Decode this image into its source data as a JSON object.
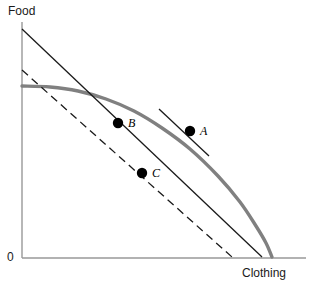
{
  "figure": {
    "width": 318,
    "height": 286,
    "background": "#ffffff"
  },
  "axes": {
    "y_title": "Food",
    "x_title": "Clothing",
    "origin_label": "0",
    "color": "#999999",
    "x_origin_px": 22,
    "y_origin_px": 258,
    "x_end_px": 306,
    "y_top_px": 22
  },
  "labels": {
    "point_a": "A",
    "point_b": "B",
    "point_c": "C"
  },
  "colors": {
    "ppf_curve": "#808080",
    "budget_line": "#1a1a1a",
    "dashed_line": "#1a1a1a",
    "tangent_line": "#1a1a1a",
    "point_fill": "#000000",
    "axis": "#999999",
    "text": "#1a1a1a"
  },
  "chart_data": {
    "type": "line",
    "title": "",
    "xlabel": "Clothing",
    "ylabel": "Food",
    "grid": false,
    "legend": "none",
    "xlim": [
      0,
      306
    ],
    "ylim": [
      0,
      258
    ],
    "series": [
      {
        "name": "Production possibility frontier",
        "style": "solid-thick",
        "color": "#808080",
        "width": 3.4,
        "points": [
          [
            22,
            86
          ],
          [
            50,
            87
          ],
          [
            78,
            91
          ],
          [
            106,
            99
          ],
          [
            134,
            111
          ],
          [
            162,
            128
          ],
          [
            190,
            149
          ],
          [
            218,
            176
          ],
          [
            240,
            202
          ],
          [
            256,
            226
          ],
          [
            266,
            243
          ],
          [
            272,
            257
          ]
        ]
      },
      {
        "name": "Budget line through A",
        "style": "solid",
        "color": "#1a1a1a",
        "width": 1.3,
        "points": [
          [
            22,
            29
          ],
          [
            262,
            257
          ]
        ]
      },
      {
        "name": "Parallel dashed budget line through C",
        "style": "dashed",
        "color": "#1a1a1a",
        "width": 1.3,
        "dash": "8 5",
        "points": [
          [
            22,
            70
          ],
          [
            232,
            257
          ]
        ]
      },
      {
        "name": "Tangent segment at A",
        "style": "solid",
        "color": "#1a1a1a",
        "width": 1.3,
        "points": [
          [
            159,
            109
          ],
          [
            209,
            156
          ]
        ]
      }
    ],
    "annotations": [
      {
        "label": "A",
        "description": "tangency point on production possibility frontier",
        "x": 190,
        "y": 131,
        "label_x": 200,
        "label_y": 124,
        "marker": "filled-circle",
        "radius": 5.2
      },
      {
        "label": "B",
        "description": "point on budget line inside frontier",
        "x": 118,
        "y": 123,
        "label_x": 128,
        "label_y": 116,
        "marker": "filled-circle",
        "radius": 5.2
      },
      {
        "label": "C",
        "description": "point on dashed parallel line",
        "x": 142,
        "y": 173,
        "label_x": 152,
        "label_y": 166,
        "marker": "filled-circle",
        "radius": 5.2
      }
    ]
  }
}
